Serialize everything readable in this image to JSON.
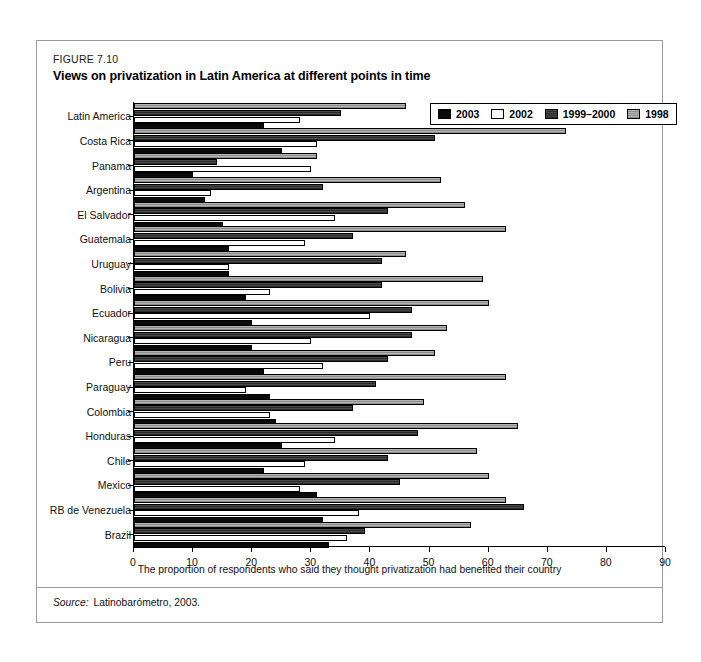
{
  "figure": {
    "number": "FIGURE 7.10",
    "title": "Views on privatization in Latin America at different points in time",
    "source_label": "Source:",
    "source_value": "Latinobarómetro, 2003."
  },
  "legend": {
    "items": [
      {
        "label": "2003",
        "color": "#0a0a0a"
      },
      {
        "label": "2002",
        "color": "#ffffff"
      },
      {
        "label": "1999–2000",
        "color": "#3a3a3a"
      },
      {
        "label": "1998",
        "color": "#9e9e9e"
      }
    ]
  },
  "chart_data": {
    "type": "bar",
    "orientation": "horizontal",
    "title": "Views on privatization in Latin America at different points in time",
    "xlabel": "The proportion of respondents who said they thought privatization had benefited their country",
    "ylabel": "",
    "xlim": [
      0,
      90
    ],
    "xticks": [
      0,
      10,
      20,
      30,
      40,
      50,
      60,
      70,
      80,
      90
    ],
    "grid": false,
    "legend_position": "top-right",
    "categories": [
      "Latin America",
      "Costa Rica",
      "Panama",
      "Argentina",
      "El Salvador",
      "Guatemala",
      "Uruguay",
      "Bolivia",
      "Ecuador",
      "Nicaragua",
      "Peru",
      "Paraguay",
      "Colombia",
      "Honduras",
      "Chile",
      "Mexico",
      "RB de Venezuela",
      "Brazil"
    ],
    "series": [
      {
        "name": "1998",
        "color": "#9e9e9e",
        "values": [
          46,
          73,
          31,
          52,
          56,
          63,
          46,
          59,
          60,
          53,
          51,
          63,
          49,
          65,
          58,
          60,
          63,
          57
        ]
      },
      {
        "name": "1999–2000",
        "color": "#3a3a3a",
        "values": [
          35,
          51,
          14,
          32,
          43,
          37,
          42,
          42,
          47,
          47,
          43,
          41,
          37,
          48,
          43,
          45,
          66,
          39
        ]
      },
      {
        "name": "2002",
        "color": "#ffffff",
        "values": [
          28,
          31,
          30,
          13,
          34,
          29,
          16,
          23,
          40,
          30,
          32,
          19,
          23,
          34,
          29,
          28,
          38,
          36
        ]
      },
      {
        "name": "2003",
        "color": "#0a0a0a",
        "values": [
          22,
          25,
          10,
          12,
          15,
          16,
          16,
          19,
          20,
          20,
          22,
          23,
          24,
          25,
          22,
          31,
          32,
          33
        ]
      }
    ]
  }
}
